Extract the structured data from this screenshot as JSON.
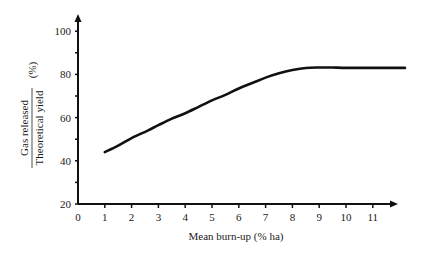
{
  "chart_data": {
    "type": "line",
    "title": "",
    "xlabel": "Mean burn-up (% ha)",
    "ylabel": {
      "numerator": "Gas released",
      "denominator": "Theoretical yield",
      "unit": "(%)"
    },
    "xlim": [
      0,
      12.2
    ],
    "ylim": [
      20,
      105
    ],
    "x_ticks": [
      0,
      1,
      2,
      3,
      4,
      5,
      6,
      7,
      8,
      9,
      10,
      11
    ],
    "y_ticks_labeled": [
      20,
      40,
      60,
      80,
      100
    ],
    "y_ticks_minor": [
      30,
      50,
      70,
      90
    ],
    "grid": false,
    "legend": null,
    "series": [
      {
        "name": "Gas released / Theoretical yield",
        "x": [
          1.0,
          1.5,
          2.0,
          2.6,
          3.0,
          3.5,
          4.0,
          4.5,
          5.0,
          5.5,
          6.0,
          6.5,
          7.0,
          7.5,
          8.0,
          8.5,
          9.0,
          9.5,
          10.0,
          11.0,
          12.2
        ],
        "y": [
          44,
          47,
          50.5,
          54,
          56.5,
          59.5,
          62,
          65,
          68,
          70.5,
          73.5,
          76,
          78.5,
          80.5,
          82,
          83,
          83.2,
          83.2,
          83,
          83,
          83
        ]
      }
    ],
    "colors": {
      "line": "#111111",
      "axis": "#111111",
      "text": "#1a1a1a"
    }
  }
}
